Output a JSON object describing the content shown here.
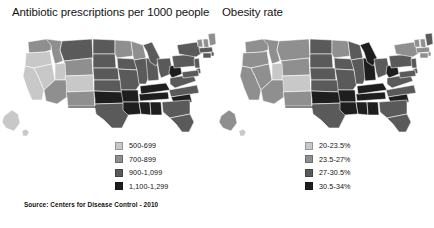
{
  "figure": {
    "source_note": "Source: Centers for Disease Control - 2010",
    "background": "#ffffff"
  },
  "panels": [
    {
      "id": "antibiotic",
      "title": "Antibiotic prescriptions per 1000 people",
      "legend": [
        {
          "label": "500-699",
          "color": "#c8c8c8"
        },
        {
          "label": "700-899",
          "color": "#8f8f8f"
        },
        {
          "label": "900-1,099",
          "color": "#5a5a5a"
        },
        {
          "label": "1,100-1,299",
          "color": "#1e1e1e"
        }
      ]
    },
    {
      "id": "obesity",
      "title": "Obesity rate",
      "legend": [
        {
          "label": "20-23.5%",
          "color": "#c8c8c8"
        },
        {
          "label": "23.5-27%",
          "color": "#8f8f8f"
        },
        {
          "label": "27-30.5%",
          "color": "#5a5a5a"
        },
        {
          "label": "30.5-34%",
          "color": "#1e1e1e"
        }
      ]
    }
  ],
  "chart_data": {
    "type": "choropleth-map-pair",
    "source": "Source: Centers for Disease Control - 2010",
    "color_scale_grayscale": [
      "#c8c8c8",
      "#8f8f8f",
      "#5a5a5a",
      "#1e1e1e"
    ],
    "maps": [
      {
        "name": "Antibiotic prescriptions per 1000 people",
        "unit": "prescriptions per 1000 people",
        "bins": [
          "500-699",
          "700-899",
          "900-1,099",
          "1,100-1,299"
        ],
        "bin_colors": [
          "#c8c8c8",
          "#8f8f8f",
          "#5a5a5a",
          "#1e1e1e"
        ],
        "states": {
          "WA": 1,
          "OR": 0,
          "CA": 0,
          "NV": 0,
          "ID": 1,
          "MT": 2,
          "WY": 1,
          "UT": 0,
          "AZ": 1,
          "CO": 0,
          "NM": 1,
          "ND": 2,
          "SD": 2,
          "NE": 2,
          "KS": 2,
          "OK": 3,
          "TX": 2,
          "MN": 1,
          "IA": 2,
          "MO": 2,
          "AR": 3,
          "LA": 3,
          "WI": 1,
          "IL": 2,
          "MS": 3,
          "AL": 3,
          "TN": 3,
          "KY": 3,
          "IN": 2,
          "MI": 2,
          "OH": 2,
          "WV": 3,
          "VA": 2,
          "NC": 2,
          "SC": 3,
          "GA": 2,
          "FL": 2,
          "PA": 2,
          "NY": 2,
          "VT": 1,
          "NH": 1,
          "ME": 1,
          "MA": 2,
          "RI": 2,
          "CT": 2,
          "NJ": 2,
          "DE": 2,
          "MD": 2,
          "AK": 0,
          "HI": 0
        }
      },
      {
        "name": "Obesity rate",
        "unit": "percent of adults",
        "bins": [
          "20-23.5%",
          "23.5-27%",
          "27-30.5%",
          "30.5-34%"
        ],
        "bin_colors": [
          "#c8c8c8",
          "#8f8f8f",
          "#5a5a5a",
          "#1e1e1e"
        ],
        "states": {
          "WA": 1,
          "OR": 1,
          "CA": 1,
          "NV": 1,
          "ID": 1,
          "MT": 1,
          "WY": 1,
          "UT": 0,
          "AZ": 1,
          "CO": 0,
          "NM": 1,
          "ND": 2,
          "SD": 2,
          "NE": 2,
          "KS": 2,
          "OK": 3,
          "TX": 2,
          "MN": 1,
          "IA": 2,
          "MO": 2,
          "AR": 3,
          "LA": 3,
          "WI": 2,
          "IL": 2,
          "MS": 3,
          "AL": 3,
          "TN": 3,
          "KY": 3,
          "IN": 3,
          "MI": 3,
          "OH": 2,
          "WV": 3,
          "VA": 2,
          "NC": 2,
          "SC": 3,
          "GA": 2,
          "FL": 2,
          "PA": 2,
          "NY": 1,
          "VT": 1,
          "NH": 1,
          "ME": 2,
          "MA": 1,
          "RI": 1,
          "CT": 1,
          "NJ": 2,
          "DE": 2,
          "MD": 2,
          "AK": 1,
          "HI": 0
        }
      }
    ]
  }
}
